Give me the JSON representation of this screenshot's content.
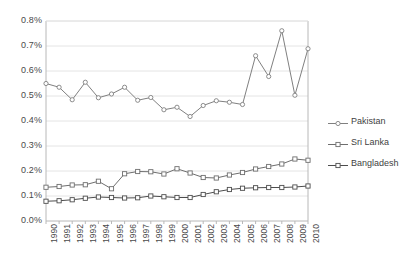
{
  "chart_data": {
    "type": "line",
    "title": "",
    "subtitle": "",
    "xlabel": "",
    "ylabel": "",
    "grid": true,
    "legend_position": "right",
    "x": [
      "1990",
      "1991",
      "1992",
      "1993",
      "1994",
      "1995",
      "1996",
      "1997",
      "1998",
      "1999",
      "2000",
      "2001",
      "2002",
      "2003",
      "2004",
      "2005",
      "2006",
      "2007",
      "2008",
      "2009",
      "2010"
    ],
    "categories": [
      "1990",
      "1991",
      "1992",
      "1993",
      "1994",
      "1995",
      "1996",
      "1997",
      "1998",
      "1999",
      "2000",
      "2001",
      "2002",
      "2003",
      "2004",
      "2005",
      "2006",
      "2007",
      "2008",
      "2009",
      "2010"
    ],
    "ylim": [
      0,
      0.8
    ],
    "ytick_labels": [
      "0.8%",
      "0.7%",
      "0.6%",
      "0.5%",
      "0.4%",
      "0.3%",
      "0.2%",
      "0.1%",
      "0.0%"
    ],
    "ytick_values": [
      0.8,
      0.7,
      0.6,
      0.5,
      0.4,
      0.3,
      0.2,
      0.1,
      0.0
    ],
    "value_suffix": "%",
    "series": [
      {
        "name": "Pakistan",
        "color": "#808080",
        "marker": "circle",
        "values": [
          0.55,
          0.535,
          0.485,
          0.555,
          0.493,
          0.508,
          0.535,
          0.483,
          0.494,
          0.445,
          0.455,
          0.418,
          0.462,
          0.481,
          0.475,
          0.466,
          0.661,
          0.578,
          0.761,
          0.503,
          0.689
        ]
      },
      {
        "name": "Sri Lanka",
        "color": "#6e6e6e",
        "marker": "square",
        "values": [
          0.135,
          0.138,
          0.144,
          0.145,
          0.159,
          0.129,
          0.189,
          0.198,
          0.197,
          0.188,
          0.209,
          0.192,
          0.174,
          0.172,
          0.184,
          0.194,
          0.208,
          0.218,
          0.228,
          0.248,
          0.243
        ]
      },
      {
        "name": "Bangladesh",
        "color": "#4d4d4d",
        "marker": "square",
        "values": [
          0.079,
          0.081,
          0.085,
          0.091,
          0.096,
          0.094,
          0.092,
          0.093,
          0.1,
          0.097,
          0.094,
          0.094,
          0.106,
          0.117,
          0.126,
          0.131,
          0.133,
          0.134,
          0.134,
          0.136,
          0.14
        ]
      }
    ]
  },
  "legend": {
    "items": [
      {
        "label": "Pakistan"
      },
      {
        "label": "Sri Lanka"
      },
      {
        "label": "Bangladesh"
      }
    ]
  },
  "colors": {
    "axis": "#b8b8b8",
    "grid": "#e4e4e4",
    "text": "#4a4a4a",
    "background": "#ffffff"
  }
}
